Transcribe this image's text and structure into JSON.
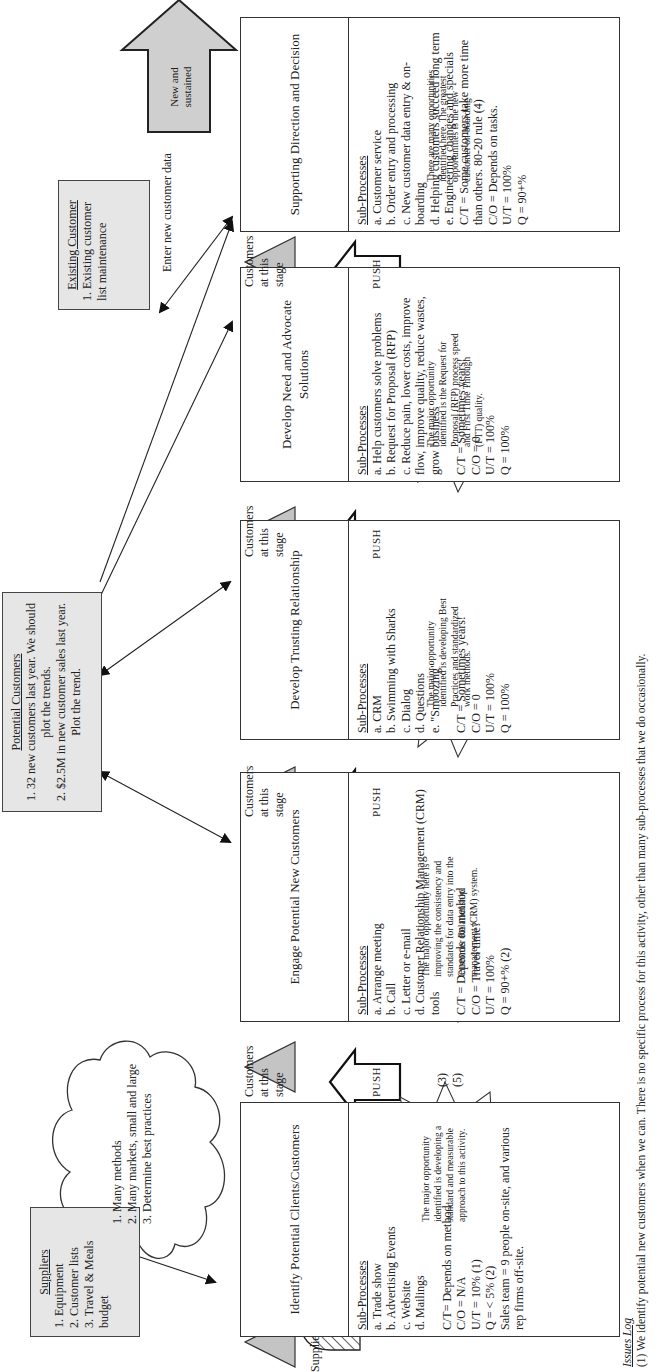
{
  "suppliers": {
    "title": "Suppliers",
    "items": [
      "1. Equipment",
      "2. Customer lists",
      "3. Travel & Meals budget"
    ]
  },
  "supplies_label": "Supplies & Equipment",
  "cloud": {
    "items": [
      "1. Many methods",
      "2. Many markets, small and large",
      "3. Determine best practices"
    ]
  },
  "potential_customers": {
    "title": "Potential Customers",
    "items": [
      "1. 32 new customers last year. We should plot the trends.",
      "2. $2.5M in new customer sales last year. Plot the trend."
    ]
  },
  "existing_customer": {
    "title": "Existing Customer",
    "items": [
      "1. Existing customer list maintenance"
    ]
  },
  "enter_data_label": "Enter new customer data",
  "output_arrow": {
    "label": "New and sustained"
  },
  "get_paid": {
    "line1": "Get paid",
    "line2": "&",
    "line3": "make money!"
  },
  "stage_label": {
    "line1": "Customers",
    "line2": "at this",
    "line3": "stage"
  },
  "push_label": "PUSH",
  "stage_notes": [
    "(3)",
    "(5)"
  ],
  "processes": [
    {
      "title": "Identify Potential Clients/Customers",
      "sub_title": "Sub-Processes",
      "sub": [
        "a. Trade show",
        "b. Advertising Events",
        "c. Website",
        "d. Mailings"
      ],
      "metrics": [
        "C/T= Depends on method",
        "C/O = N/A",
        "U/T = 10% (1)",
        "Q = < 5% (2)",
        "Sales team = 9 people on-site, and various rep firms off-site."
      ],
      "burst": "The major opportunity identified is developing a standard and measurable approach to this activity."
    },
    {
      "title": "Engage Potential New Customers",
      "sub_title": "Sub-Processes",
      "sub": [
        "a. Arrange meeting",
        "b. Call",
        "c. Letter or e-mail",
        "d. Customer Relationship Management (CRM) tools"
      ],
      "metrics": [
        "C/T = Depends on method",
        "C/O = Travel time?",
        "U/T = 100%",
        "Q = 90+% (2)"
      ],
      "burst": "The major opportunity here is improving the consistency and standards for data entry into the Customer Relationship management (CRM) system."
    },
    {
      "title": "Develop Trusting Relationship",
      "sub_title": "Sub-Processes",
      "sub": [
        "a. CRM",
        "b. Swimming with Sharks",
        "c. Dialog",
        "d. Questions",
        "e. \"Smoozing\""
      ],
      "metrics": [
        "C/T = Sometimes years!",
        "C/O = 0",
        "U/T = 100%",
        "Q = 100%"
      ],
      "burst": "The major opportunity identified is developing Best Practices and standardized work methods."
    },
    {
      "title": "Develop Need and Advocate Solutions",
      "sub_title": "Sub-Processes",
      "sub": [
        "a. Help customers solve problems",
        "b. Request for Proposal (RFP)",
        "c. Reduce pain, lower costs, improve flow, improve quality, reduce wastes, grow business"
      ],
      "metrics": [
        "C/T = Sometimes years!",
        "C/O = 0",
        "U/T = 100%",
        "Q = 100%"
      ],
      "burst": "The major opportunity identified is the Request for Proposal (RFP) process speed and First Time Through (FTT) quality."
    },
    {
      "title": "Supporting Direction and Decision",
      "sub_title": "Sub-Processes",
      "sub": [
        "a. Customer service",
        "b. Order entry and processing",
        "c. New customer data entry & on-boarding",
        "d. Helping customers succeed long term",
        "e. Engineering changes and specials"
      ],
      "metrics": [
        "C/T = Some customers take more time than others. 80-20 rule (4)",
        "C/O = Depends on tasks.",
        "U/T = 100%",
        "Q = 90+%"
      ],
      "burst": "There are many opportunities identified here. The greatest opportunities is the new customer on-boarding"
    }
  ],
  "issues_log": {
    "title": "Issues Log",
    "items": [
      "(1) We identify potential new customers when we can. There is no specific process for this activity, other than many sub-processes that we do occasionally."
    ]
  },
  "colors": {
    "box_fill": "#e6e6e6",
    "triangle_fill": "#bdbdbd",
    "stroke": "#333333"
  }
}
